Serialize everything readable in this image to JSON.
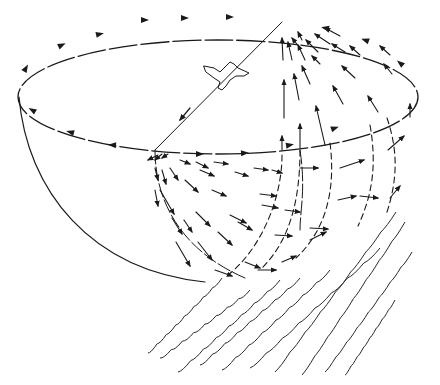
{
  "diagram": {
    "colors": {
      "ink": "#1a1a1a",
      "background": "#ffffff"
    },
    "rim_ellipse": {
      "cx": 218,
      "cy": 97,
      "rx": 200,
      "ry": 57
    },
    "bowl": {
      "left_x": 19,
      "top_y": 97,
      "bottom_x": 205,
      "bottom_y": 282
    },
    "source_point": {
      "x": 155,
      "y": 150
    },
    "sink_point": {
      "x": 282,
      "y": 22
    },
    "bird": {
      "x": 230,
      "y": 68,
      "label": "bird-silhouette"
    },
    "rim_arrows": [
      {
        "x": 145,
        "y": 20,
        "angle": 0
      },
      {
        "x": 185,
        "y": 18,
        "angle": 0
      },
      {
        "x": 230,
        "y": 17,
        "angle": 0
      },
      {
        "x": 100,
        "y": 34,
        "angle": -12
      },
      {
        "x": 62,
        "y": 45,
        "angle": -25
      },
      {
        "x": 26,
        "y": 68,
        "angle": -60
      },
      {
        "x": 32,
        "y": 110,
        "angle": 210
      },
      {
        "x": 70,
        "y": 132,
        "angle": 195
      },
      {
        "x": 112,
        "y": 145,
        "angle": 185
      },
      {
        "x": 200,
        "y": 154,
        "angle": 0
      },
      {
        "x": 245,
        "y": 153,
        "angle": -4
      },
      {
        "x": 290,
        "y": 145,
        "angle": -10
      },
      {
        "x": 335,
        "y": 128,
        "angle": -20
      },
      {
        "x": 400,
        "y": 63,
        "angle": 220
      },
      {
        "x": 365,
        "y": 40,
        "angle": 200
      },
      {
        "x": 325,
        "y": 28,
        "angle": 190
      }
    ],
    "field_arrows": [
      {
        "x1": 283,
        "y1": 60,
        "x2": 282,
        "y2": 38
      },
      {
        "x1": 292,
        "y1": 60,
        "x2": 288,
        "y2": 42
      },
      {
        "x1": 305,
        "y1": 60,
        "x2": 298,
        "y2": 45
      },
      {
        "x1": 318,
        "y1": 52,
        "x2": 306,
        "y2": 40
      },
      {
        "x1": 330,
        "y1": 44,
        "x2": 315,
        "y2": 34
      },
      {
        "x1": 340,
        "y1": 36,
        "x2": 325,
        "y2": 28
      },
      {
        "x1": 302,
        "y1": 40,
        "x2": 298,
        "y2": 32
      },
      {
        "x1": 300,
        "y1": 48,
        "x2": 292,
        "y2": 38
      },
      {
        "x1": 284,
        "y1": 118,
        "x2": 284,
        "y2": 80
      },
      {
        "x1": 299,
        "y1": 100,
        "x2": 294,
        "y2": 74
      },
      {
        "x1": 310,
        "y1": 84,
        "x2": 302,
        "y2": 66
      },
      {
        "x1": 320,
        "y1": 64,
        "x2": 312,
        "y2": 56
      },
      {
        "x1": 345,
        "y1": 52,
        "x2": 332,
        "y2": 44
      },
      {
        "x1": 360,
        "y1": 55,
        "x2": 350,
        "y2": 46
      },
      {
        "x1": 390,
        "y1": 55,
        "x2": 380,
        "y2": 46
      },
      {
        "x1": 355,
        "y1": 78,
        "x2": 342,
        "y2": 66
      },
      {
        "x1": 392,
        "y1": 74,
        "x2": 384,
        "y2": 64
      },
      {
        "x1": 343,
        "y1": 104,
        "x2": 333,
        "y2": 86
      },
      {
        "x1": 378,
        "y1": 112,
        "x2": 368,
        "y2": 96
      },
      {
        "x1": 325,
        "y1": 145,
        "x2": 316,
        "y2": 106
      },
      {
        "x1": 410,
        "y1": 117,
        "x2": 410,
        "y2": 104
      },
      {
        "x1": 282,
        "y1": 150,
        "x2": 282,
        "y2": 136
      },
      {
        "x1": 300,
        "y1": 148,
        "x2": 300,
        "y2": 124
      }
    ],
    "lower_arrows": [
      {
        "x1": 158,
        "y1": 155,
        "x2": 148,
        "y2": 160
      },
      {
        "x1": 162,
        "y1": 154,
        "x2": 155,
        "y2": 160
      },
      {
        "x1": 168,
        "y1": 154,
        "x2": 162,
        "y2": 158
      },
      {
        "x1": 180,
        "y1": 160,
        "x2": 190,
        "y2": 164
      },
      {
        "x1": 196,
        "y1": 162,
        "x2": 208,
        "y2": 168
      },
      {
        "x1": 200,
        "y1": 170,
        "x2": 214,
        "y2": 176
      },
      {
        "x1": 214,
        "y1": 162,
        "x2": 228,
        "y2": 164
      },
      {
        "x1": 235,
        "y1": 172,
        "x2": 248,
        "y2": 176
      },
      {
        "x1": 155,
        "y1": 168,
        "x2": 158,
        "y2": 180
      },
      {
        "x1": 162,
        "y1": 170,
        "x2": 166,
        "y2": 184
      },
      {
        "x1": 170,
        "y1": 168,
        "x2": 178,
        "y2": 180
      },
      {
        "x1": 185,
        "y1": 180,
        "x2": 198,
        "y2": 192
      },
      {
        "x1": 212,
        "y1": 190,
        "x2": 226,
        "y2": 196
      },
      {
        "x1": 254,
        "y1": 168,
        "x2": 268,
        "y2": 170
      },
      {
        "x1": 272,
        "y1": 170,
        "x2": 282,
        "y2": 173
      },
      {
        "x1": 300,
        "y1": 168,
        "x2": 318,
        "y2": 168
      },
      {
        "x1": 155,
        "y1": 190,
        "x2": 158,
        "y2": 206
      },
      {
        "x1": 160,
        "y1": 190,
        "x2": 174,
        "y2": 214
      },
      {
        "x1": 172,
        "y1": 218,
        "x2": 182,
        "y2": 234
      },
      {
        "x1": 184,
        "y1": 220,
        "x2": 192,
        "y2": 232
      },
      {
        "x1": 196,
        "y1": 212,
        "x2": 210,
        "y2": 226
      },
      {
        "x1": 198,
        "y1": 242,
        "x2": 212,
        "y2": 260
      },
      {
        "x1": 176,
        "y1": 242,
        "x2": 190,
        "y2": 266
      },
      {
        "x1": 218,
        "y1": 232,
        "x2": 232,
        "y2": 245
      },
      {
        "x1": 230,
        "y1": 215,
        "x2": 246,
        "y2": 223
      },
      {
        "x1": 238,
        "y1": 222,
        "x2": 252,
        "y2": 230
      },
      {
        "x1": 262,
        "y1": 205,
        "x2": 278,
        "y2": 208
      },
      {
        "x1": 260,
        "y1": 194,
        "x2": 276,
        "y2": 196
      },
      {
        "x1": 275,
        "y1": 235,
        "x2": 292,
        "y2": 236
      },
      {
        "x1": 310,
        "y1": 228,
        "x2": 328,
        "y2": 229
      },
      {
        "x1": 285,
        "y1": 210,
        "x2": 300,
        "y2": 212
      },
      {
        "x1": 310,
        "y1": 240,
        "x2": 326,
        "y2": 232
      },
      {
        "x1": 338,
        "y1": 200,
        "x2": 356,
        "y2": 196
      },
      {
        "x1": 360,
        "y1": 196,
        "x2": 378,
        "y2": 198
      },
      {
        "x1": 340,
        "y1": 168,
        "x2": 364,
        "y2": 160
      },
      {
        "x1": 390,
        "y1": 198,
        "x2": 400,
        "y2": 186
      },
      {
        "x1": 388,
        "y1": 150,
        "x2": 404,
        "y2": 136
      },
      {
        "x1": 245,
        "y1": 262,
        "x2": 260,
        "y2": 268
      },
      {
        "x1": 258,
        "y1": 270,
        "x2": 276,
        "y2": 270
      },
      {
        "x1": 282,
        "y1": 262,
        "x2": 296,
        "y2": 256
      },
      {
        "x1": 215,
        "y1": 270,
        "x2": 232,
        "y2": 276
      }
    ],
    "dashed_meridians": [
      "M 282 155 C 282 200 260 250 228 275",
      "M 300 150 C 300 200 290 240 262 268",
      "M 330 143 C 336 190 326 230 296 258",
      "M 370 125 C 378 170 370 200 358 226",
      "M 387 118 C 398 150 398 180 386 215"
    ],
    "solid_curves": [
      "M 155 150 C 155 200 180 250 245 278",
      "M 300 150 C 306 190 300 210 300 230"
    ],
    "wave_lines": [
      {
        "x0": 148,
        "y0": 353,
        "x1": 222,
        "y1": 278
      },
      {
        "x0": 160,
        "y0": 358,
        "x1": 250,
        "y1": 290
      },
      {
        "x0": 178,
        "y0": 372,
        "x1": 280,
        "y1": 280
      },
      {
        "x0": 200,
        "y0": 365,
        "x1": 300,
        "y1": 278
      },
      {
        "x0": 222,
        "y0": 370,
        "x1": 330,
        "y1": 270
      },
      {
        "x0": 250,
        "y0": 368,
        "x1": 380,
        "y1": 248
      },
      {
        "x0": 275,
        "y0": 372,
        "x1": 396,
        "y1": 212
      },
      {
        "x0": 302,
        "y0": 375,
        "x1": 405,
        "y1": 222
      },
      {
        "x0": 325,
        "y0": 372,
        "x1": 412,
        "y1": 252
      },
      {
        "x0": 345,
        "y0": 375,
        "x1": 395,
        "y1": 300
      }
    ]
  }
}
